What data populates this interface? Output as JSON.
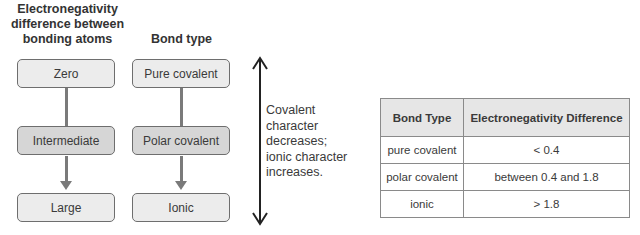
{
  "headings": {
    "left": [
      "Electronegativity",
      "difference between",
      "bonding atoms"
    ],
    "middle": "Bond type"
  },
  "left_column": [
    "Zero",
    "Intermediate",
    "Large"
  ],
  "middle_column": [
    "Pure covalent",
    "Polar covalent",
    "Ionic"
  ],
  "trend_note": [
    "Covalent",
    "character",
    "decreases;",
    "ionic character",
    "increases."
  ],
  "table": {
    "headers": [
      "Bond Type",
      "Electronegativity Difference"
    ],
    "rows": [
      [
        "pure covalent",
        "< 0.4"
      ],
      [
        "polar covalent",
        "between 0.4 and 1.8"
      ],
      [
        "ionic",
        "> 1.8"
      ]
    ]
  }
}
